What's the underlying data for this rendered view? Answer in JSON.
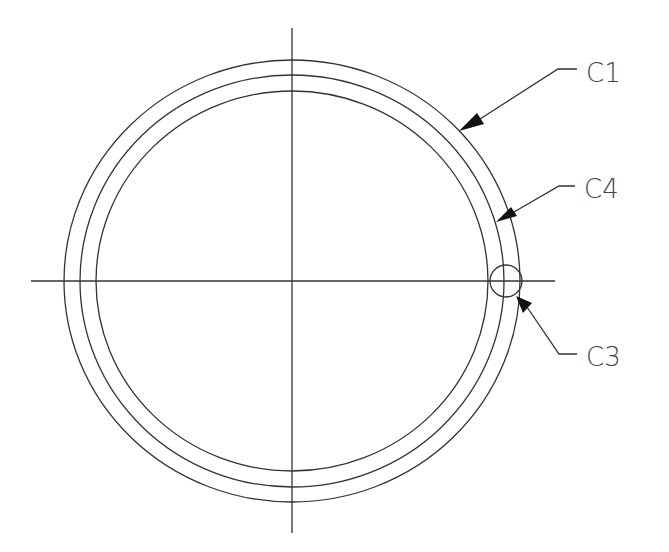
{
  "drawing": {
    "center": {
      "x": 292,
      "y": 281
    },
    "circles": [
      {
        "id": "C1",
        "rx": 228,
        "ry": 221
      },
      {
        "id": "C4",
        "rx": 212,
        "ry": 206
      },
      {
        "id": "inner",
        "rx": 196,
        "ry": 190
      }
    ],
    "small_circle": {
      "id": "C3",
      "cx": 506,
      "cy": 281,
      "r": 16
    },
    "labels": {
      "c1": "C1",
      "c4": "C4",
      "c3": "C3"
    }
  }
}
